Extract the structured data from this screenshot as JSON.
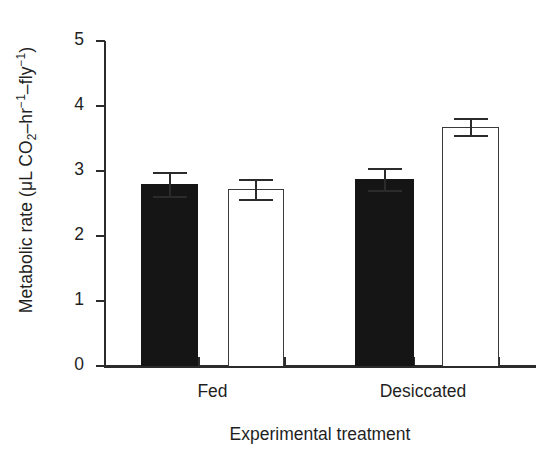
{
  "chart_data": {
    "type": "bar",
    "title": "",
    "xlabel": "Experimental treatment",
    "ylabel": "Metabolic rate (μL CO2–hr−1–fly−1)",
    "ylabel_parts": {
      "prefix": "Metabolic rate (",
      "unit_mu": "μL CO",
      "co2_sub": "2",
      "dash1": "–hr",
      "sup1": "−1",
      "dash2": "–fly",
      "sup2": "−1",
      "suffix": ")"
    },
    "categories": [
      "Fed",
      "Desiccated"
    ],
    "ylim": [
      0,
      5
    ],
    "yticks": [
      0,
      1,
      2,
      3,
      4,
      5
    ],
    "ytick_labels": [
      "0",
      "1",
      "2",
      "3",
      "4",
      "5"
    ],
    "grid": false,
    "legend_position": "none",
    "series": [
      {
        "name": "filled",
        "fill": "#151515",
        "style": "solid-black",
        "values": [
          2.8,
          2.88
        ],
        "errors": [
          0.18,
          0.17
        ]
      },
      {
        "name": "open",
        "fill": "#ffffff",
        "style": "open-outline",
        "values": [
          2.72,
          3.68
        ],
        "errors": [
          0.15,
          0.13
        ]
      }
    ],
    "bars": [
      {
        "group": "Fed",
        "series": "filled",
        "value": 2.8,
        "error": 0.18
      },
      {
        "group": "Fed",
        "series": "open",
        "value": 2.72,
        "error": 0.15
      },
      {
        "group": "Desiccated",
        "series": "filled",
        "value": 2.88,
        "error": 0.17
      },
      {
        "group": "Desiccated",
        "series": "open",
        "value": 3.68,
        "error": 0.13
      }
    ]
  },
  "colors": {
    "axis": "#2b2b2b",
    "filled_bar": "#151515",
    "open_bar_outline": "#3a3a3a",
    "background": "#ffffff",
    "text": "#1f1f1f"
  }
}
